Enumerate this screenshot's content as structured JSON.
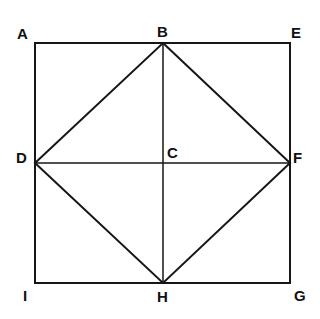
{
  "diagram": {
    "type": "geometric-figure",
    "canvas": {
      "width": 320,
      "height": 319,
      "background": "#ffffff"
    },
    "colors": {
      "stroke": "#161616",
      "background": "#ffffff"
    },
    "stroke_widths": {
      "outer_square": 2,
      "diamond": 2,
      "center_lines": 1.5
    },
    "points": [
      {
        "id": "A",
        "label": "A",
        "x": 35,
        "y": 43,
        "role": "square-corner-top-left"
      },
      {
        "id": "B",
        "label": "B",
        "x": 163,
        "y": 43,
        "role": "midpoint-top"
      },
      {
        "id": "E",
        "label": "E",
        "x": 290,
        "y": 43,
        "role": "square-corner-top-right"
      },
      {
        "id": "D",
        "label": "D",
        "x": 35,
        "y": 163,
        "role": "midpoint-left"
      },
      {
        "id": "C",
        "label": "C",
        "x": 163,
        "y": 163,
        "role": "center"
      },
      {
        "id": "F",
        "label": "F",
        "x": 290,
        "y": 163,
        "role": "midpoint-right"
      },
      {
        "id": "I",
        "label": "I",
        "x": 35,
        "y": 283,
        "role": "square-corner-bottom-left"
      },
      {
        "id": "H",
        "label": "H",
        "x": 163,
        "y": 283,
        "role": "midpoint-bottom"
      },
      {
        "id": "G",
        "label": "G",
        "x": 290,
        "y": 283,
        "role": "square-corner-bottom-right"
      }
    ],
    "outer_square": {
      "name": "AEGI",
      "path": "M 35 43 L 290 43 L 290 283 L 35 283 Z"
    },
    "inscribed_diamond": {
      "name": "BFHD",
      "path": "M 163 43 L 290 163 L 163 283 L 35 163 Z"
    },
    "center_lines": [
      {
        "name": "vertical-BH",
        "x1": 163,
        "y1": 43,
        "x2": 163,
        "y2": 283
      },
      {
        "name": "horizontal-DF",
        "x1": 35,
        "y1": 163,
        "x2": 290,
        "y2": 163
      }
    ],
    "labels": {
      "A": "A",
      "B": "B",
      "C": "C",
      "D": "D",
      "E": "E",
      "F": "F",
      "G": "G",
      "H": "H",
      "I": "I"
    }
  }
}
